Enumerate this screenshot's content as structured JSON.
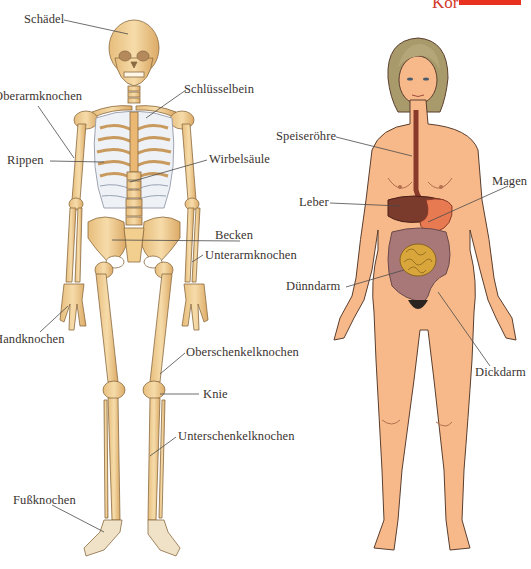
{
  "header": {
    "corner_text": "Kör",
    "accent_color": "#e8321f"
  },
  "skeleton": {
    "title": "Skelett",
    "labels": [
      {
        "id": "schaedel",
        "text": "Schädel",
        "x": 24,
        "y": 13
      },
      {
        "id": "oberarmknochen",
        "text": "Oberarmknochen",
        "x": -6,
        "y": 90
      },
      {
        "id": "schluesselbein",
        "text": "Schlüsselbein",
        "x": 184,
        "y": 83
      },
      {
        "id": "rippen",
        "text": "Rippen",
        "x": 7,
        "y": 154
      },
      {
        "id": "wirbelsaeule",
        "text": "Wirbelsäule",
        "x": 209,
        "y": 153
      },
      {
        "id": "becken",
        "text": "Becken",
        "x": 215,
        "y": 229
      },
      {
        "id": "unterarmknochen",
        "text": "Unterarmknochen",
        "x": 205,
        "y": 249
      },
      {
        "id": "handknochen",
        "text": "Handknochen",
        "x": -6,
        "y": 333
      },
      {
        "id": "oberschenkelknochen",
        "text": "Oberschenkelknochen",
        "x": 186,
        "y": 346
      },
      {
        "id": "knie",
        "text": "Knie",
        "x": 203,
        "y": 388
      },
      {
        "id": "unterschenkelknochen",
        "text": "Unterschenkelknochen",
        "x": 178,
        "y": 430
      },
      {
        "id": "fussknochen",
        "text": "Fußknochen",
        "x": 13,
        "y": 494
      }
    ]
  },
  "body": {
    "title": "Verdauungsorgane",
    "labels": [
      {
        "id": "speiseroehre",
        "text": "Speiseröhre",
        "x": 276,
        "y": 130
      },
      {
        "id": "magen",
        "text": "Magen",
        "x": 492,
        "y": 175
      },
      {
        "id": "leber",
        "text": "Leber",
        "x": 299,
        "y": 196
      },
      {
        "id": "duenndarm",
        "text": "Dünndarm",
        "x": 286,
        "y": 280
      },
      {
        "id": "dickdarm",
        "text": "Dickdarm",
        "x": 475,
        "y": 366
      }
    ]
  },
  "colors": {
    "bone": "#f1d39a",
    "bone_shade": "#d9a866",
    "bone_outline": "#8a6a40",
    "skin": "#f7b98a",
    "skin_shade": "#ef9d6c",
    "skin_outline": "#5a3e2e",
    "hair": "#a99a6c",
    "liver": "#7a3a2c",
    "stomach": "#e87a52",
    "colon": "#a87878",
    "small_intestine": "#d8a63a",
    "leader_line": "#4a4a4a",
    "label_text": "#3a3330"
  }
}
